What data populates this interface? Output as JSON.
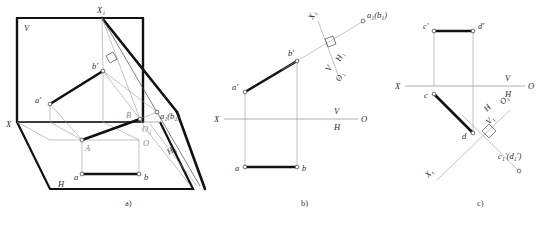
{
  "figure": {
    "type": "descriptive-geometry-plate",
    "background": "#ffffff",
    "ink": "#111111",
    "thin_ink": "#9a9a9a",
    "captions": [
      {
        "id": "a",
        "text": "a)",
        "x": 125,
        "y": 206
      },
      {
        "id": "b",
        "text": "b)",
        "x": 301,
        "y": 206
      },
      {
        "id": "c",
        "text": "c)",
        "x": 477,
        "y": 206
      }
    ]
  },
  "panel_a": {
    "name": "pictorial-two-plane-model",
    "labels": {
      "x1": "X₁",
      "v": "V",
      "h": "H",
      "x": "X",
      "h1": "H₁",
      "o": "O",
      "o1": "O₁",
      "a_prime": "a′",
      "b_prime": "b′",
      "a_low": "a",
      "b_low": "b",
      "A": "A",
      "B": "B",
      "a1b1": "a₁(b₁)"
    }
  },
  "panel_b": {
    "name": "orthographic-epure-ab",
    "labels": {
      "x": "X",
      "o": "O",
      "v": "V",
      "h": "H",
      "x1": "X₁",
      "h1": "H₁",
      "v_rot": "V",
      "o1": "O₁",
      "a_prime": "a′",
      "b_prime": "b′",
      "a_low": "a",
      "b_low": "b",
      "a1b1": "a₁(b₁)"
    }
  },
  "panel_c": {
    "name": "orthographic-epure-cd",
    "labels": {
      "x": "X",
      "o": "O",
      "v": "V",
      "h": "H",
      "x1": "X₁",
      "h_rot": "H",
      "v1": "V₁",
      "o1": "O₁",
      "c_prime": "c′",
      "d_prime": "d′",
      "c_low": "c",
      "d_low": "d",
      "c1d1": "c₁′(d₁′)"
    }
  }
}
